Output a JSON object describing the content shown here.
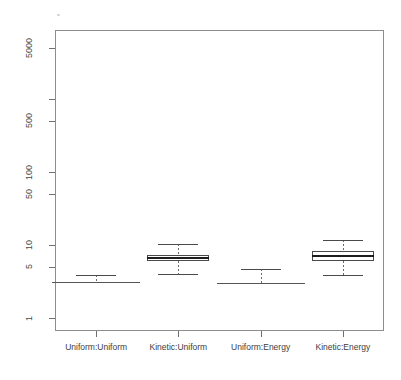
{
  "figure": {
    "background_color": "#ffffff",
    "frame_color": "#8d8d8d",
    "speck_label": ""
  },
  "chart_data": {
    "type": "box",
    "title": "",
    "subtitle": "",
    "xlabel": "",
    "ylabel": "",
    "yscale": "log",
    "grid": false,
    "legend": null,
    "ylim": [
      1,
      10000
    ],
    "ytick_values": [
      1,
      5,
      10,
      50,
      100,
      500,
      5000
    ],
    "ytick_labels": [
      "1",
      "5",
      "10",
      "50",
      "100",
      "500",
      "5000"
    ],
    "yminor_tick_values": [
      1000
    ],
    "categories": [
      "Uniform:Uniform",
      "Kinetic:Uniform",
      "Uniform:Energy",
      "Kinetic:Energy"
    ],
    "boxes": [
      {
        "name": "Uniform:Uniform",
        "lower_whisker": 3.1,
        "q1": 3.1,
        "median": 3.1,
        "q3": 3.1,
        "upper_whisker": 3.9,
        "degenerate": true
      },
      {
        "name": "Kinetic:Uniform",
        "lower_whisker": 4.0,
        "q1": 6.1,
        "median": 6.6,
        "q3": 7.3,
        "upper_whisker": 10.4,
        "degenerate": false
      },
      {
        "name": "Uniform:Energy",
        "lower_whisker": 3.0,
        "q1": 3.0,
        "median": 3.0,
        "q3": 3.0,
        "upper_whisker": 4.7,
        "degenerate": true
      },
      {
        "name": "Kinetic:Energy",
        "lower_whisker": 3.9,
        "q1": 6.0,
        "median": 7.1,
        "q3": 8.2,
        "upper_whisker": 11.8,
        "degenerate": false
      }
    ]
  }
}
